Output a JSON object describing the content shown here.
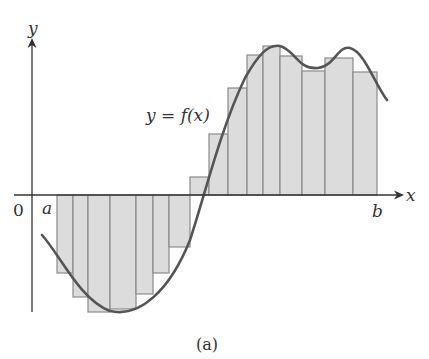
{
  "figure": {
    "caption": "(a)",
    "curve_label": "y = f(x)",
    "x_axis_label": "x",
    "y_axis_label": "y",
    "origin_label": "0",
    "left_endpoint_label": "a",
    "right_endpoint_label": "b"
  },
  "colors": {
    "axis": "#333333",
    "curve": "#555555",
    "rect_fill": "#dcdcdc",
    "rect_stroke": "#8a8a8a",
    "background": "#ffffff"
  },
  "chart_data": {
    "type": "area",
    "caption": "(a)",
    "xlabel": "x",
    "ylabel": "y",
    "x_ticks": [
      "0",
      "a",
      "b"
    ],
    "curve_label": "y = f(x)",
    "axis_pixel": {
      "x_axis_y": 195,
      "y_axis_x": 32
    },
    "rectangles": [
      {
        "x0": 57,
        "x1": 73,
        "top": 195,
        "bottom": 273
      },
      {
        "x0": 73,
        "x1": 88,
        "top": 195,
        "bottom": 297
      },
      {
        "x0": 88,
        "x1": 110,
        "top": 195,
        "bottom": 312
      },
      {
        "x0": 110,
        "x1": 136,
        "top": 195,
        "bottom": 309
      },
      {
        "x0": 136,
        "x1": 153,
        "top": 195,
        "bottom": 294
      },
      {
        "x0": 153,
        "x1": 169,
        "top": 195,
        "bottom": 273
      },
      {
        "x0": 169,
        "x1": 190,
        "top": 195,
        "bottom": 247
      },
      {
        "x0": 190,
        "x1": 209,
        "top": 177,
        "bottom": 195
      },
      {
        "x0": 209,
        "x1": 228,
        "top": 134,
        "bottom": 195
      },
      {
        "x0": 228,
        "x1": 247,
        "top": 88,
        "bottom": 195
      },
      {
        "x0": 247,
        "x1": 263,
        "top": 55,
        "bottom": 195
      },
      {
        "x0": 263,
        "x1": 280,
        "top": 46,
        "bottom": 195
      },
      {
        "x0": 280,
        "x1": 302,
        "top": 56,
        "bottom": 195
      },
      {
        "x0": 302,
        "x1": 325,
        "top": 71,
        "bottom": 195
      },
      {
        "x0": 325,
        "x1": 353,
        "top": 58,
        "bottom": 195
      },
      {
        "x0": 353,
        "x1": 377,
        "top": 72,
        "bottom": 195
      }
    ],
    "signed_heights": [
      -78,
      -102,
      -117,
      -114,
      -99,
      -78,
      -52,
      18,
      61,
      107,
      140,
      149,
      139,
      124,
      137,
      123
    ],
    "curve_path": "M42,235 C60,255 80,300 110,311 C140,318 170,290 190,240 C205,195 220,130 245,78 C258,55 268,44 280,46 C295,50 298,70 318,68 C335,66 338,45 350,48 C365,52 375,85 387,100",
    "grid": false,
    "legend": "none"
  }
}
